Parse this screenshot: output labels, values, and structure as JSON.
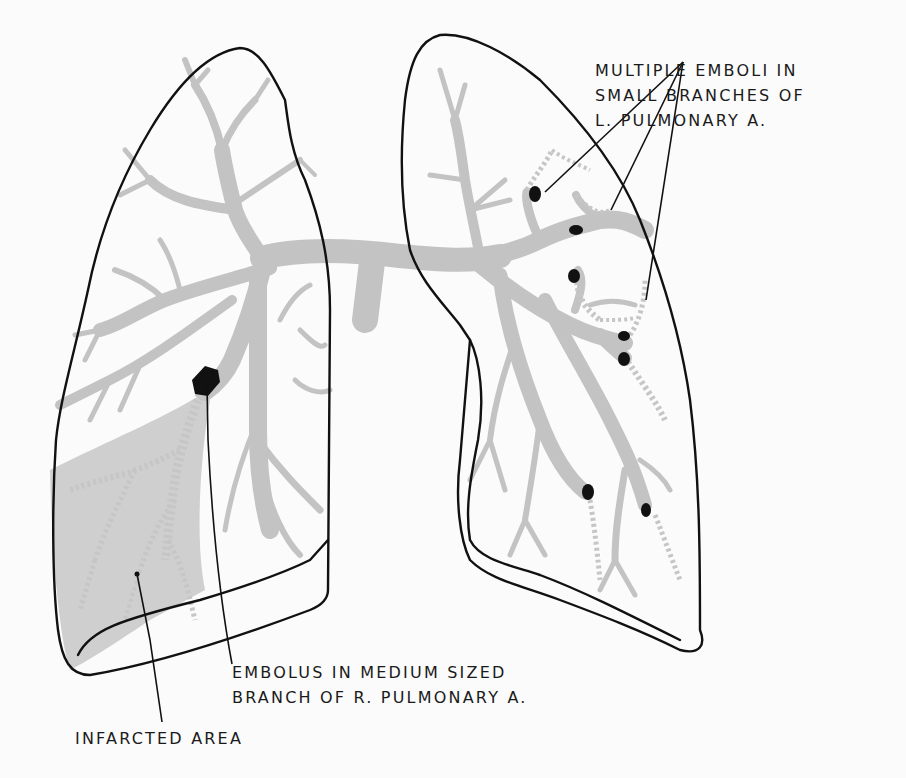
{
  "figure": {
    "colors": {
      "background": "#fbfbfb",
      "outline": "#111111",
      "vessel": "#c3c3c3",
      "infarct": "#cfcfcf",
      "embolus": "#111111"
    }
  },
  "labels": {
    "left_lung_emboli": {
      "lines": [
        "MULTIPLE EMBOLI IN",
        "SMALL BRANCHES OF",
        "L. PULMONARY A."
      ]
    },
    "right_lung_embolus": {
      "lines": [
        "EMBOLUS IN MEDIUM SIZED",
        "BRANCH OF R. PULMONARY A."
      ]
    },
    "infarct": {
      "lines": [
        "INFARCTED AREA"
      ]
    }
  }
}
